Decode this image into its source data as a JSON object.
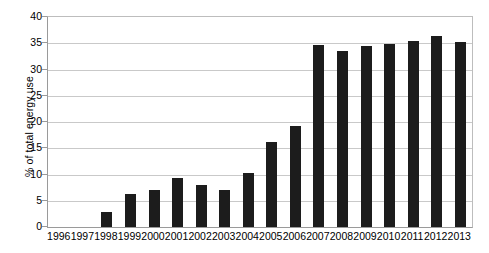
{
  "chart_data": {
    "type": "bar",
    "title": "",
    "xlabel": "",
    "ylabel": "% of total energy use",
    "ylim": [
      0,
      40
    ],
    "ytick_values": [
      0,
      5,
      10,
      15,
      20,
      25,
      30,
      35,
      40
    ],
    "ytick_labels": [
      "0",
      "5",
      "10",
      "15",
      "20",
      "25",
      "30",
      "35",
      "40"
    ],
    "grid": true,
    "legend": false,
    "legend_position": "none",
    "bar_color": "#1c1c1c",
    "gridline_color": "#c9c9c9",
    "axis_color": "#9a9a9a",
    "background_color": "#ffffff",
    "categories": [
      "1996",
      "1997",
      "1998",
      "1999",
      "2000",
      "2001",
      "2002",
      "2003",
      "2004",
      "2005",
      "2006",
      "2007",
      "2008",
      "2009",
      "2010",
      "2011",
      "2012",
      "2013"
    ],
    "values": [
      0,
      0,
      2.9,
      6.2,
      7.0,
      9.3,
      8.0,
      7.0,
      10.2,
      16.2,
      19.3,
      34.6,
      33.5,
      34.5,
      34.8,
      35.4,
      36.4,
      35.3
    ]
  }
}
